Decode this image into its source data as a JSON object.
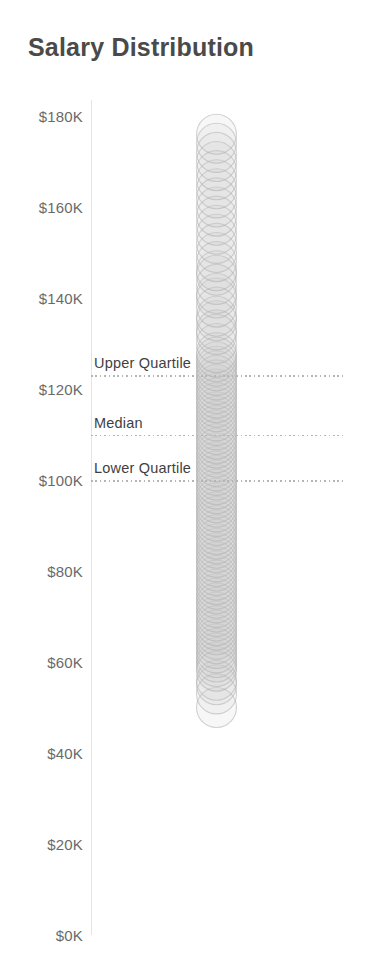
{
  "page": {
    "background_color": "#ffffff"
  },
  "chart_data": {
    "type": "scatter",
    "title": "Salary Distribution",
    "xlabel": "",
    "ylabel": "",
    "legend": "none",
    "grid": "off",
    "marks": {
      "shape": "open-circle",
      "stroke_color": "#aeaeae",
      "fill_color": "#c9c9c9"
    },
    "accent_colors": {
      "title_text": "#4a4a4a",
      "tick_text": "#6a6a6a",
      "reference_line": "#b5b5b5",
      "reference_label_text": "#3f3f3f"
    },
    "y_axis": {
      "min": 0,
      "max": 180,
      "tick_step": 20,
      "unit": "USD thousands",
      "tick_labels": [
        "$0K",
        "$20K",
        "$40K",
        "$60K",
        "$80K",
        "$100K",
        "$120K",
        "$140K",
        "$160K",
        "$180K"
      ]
    },
    "points_unit": "salary in USD thousands",
    "points": [
      50,
      53,
      55,
      56,
      58,
      59,
      60,
      61,
      62,
      63,
      64,
      65,
      66,
      67,
      68,
      69,
      70,
      71,
      72,
      73,
      74,
      75,
      76,
      77,
      78,
      79,
      80,
      81,
      82,
      83,
      84,
      85,
      86,
      87,
      88,
      89,
      90,
      91,
      92,
      93,
      94,
      95,
      96,
      97,
      98,
      99,
      100,
      101,
      102,
      103,
      104,
      105,
      106,
      107,
      108,
      109,
      110,
      111,
      112,
      113,
      114,
      115,
      116,
      117,
      118,
      119,
      120,
      121,
      122,
      123,
      124,
      125,
      126,
      127,
      128,
      130,
      132,
      133,
      135,
      136,
      138,
      140,
      141,
      143,
      145,
      146,
      148,
      150,
      152,
      154,
      156,
      158,
      160,
      162,
      164,
      166,
      168,
      170,
      172,
      174,
      176
    ],
    "reference_lines": [
      {
        "label": "Upper Quartile",
        "value": 123
      },
      {
        "label": "Median",
        "value": 110
      },
      {
        "label": "Lower Quartile",
        "value": 100
      }
    ]
  }
}
